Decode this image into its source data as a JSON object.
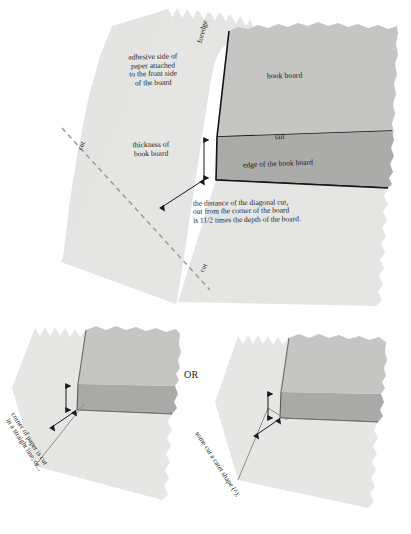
{
  "figure": {
    "title_alt": "Covering a book board corner",
    "colors": {
      "paper": "#e3e3e1",
      "paper_shadow": "#d6d6d4",
      "board_top": "#c3c3c1",
      "board_edge": "#a9a9a7",
      "outline": "#141414",
      "dashed_cut": "#9a9a98",
      "arrow": "#1a1a1a",
      "background": "#ffffff",
      "text": "#1d1d1d"
    }
  },
  "top_diagram": {
    "labels": {
      "adhesive": "adhesive side of\npaper attached\nto the front side\nof the board",
      "foredge": "foredge",
      "book_board": "book board",
      "tail": "tail",
      "edge_of_board": "edge of the book board",
      "thickness": "thickness of\nbook board",
      "distance_note": "the distance of the diagonal cut,\nout from the corner of the board\nis 11/2 times the depth of the board.",
      "cut_upper": "cut",
      "cut_lower": "cut"
    }
  },
  "bottom_left_diagram": {
    "caption_line_1": "corner of paper is cut",
    "caption_line_2": "in a straight line, or..."
  },
  "separator": {
    "or_label": "OR"
  },
  "bottom_right_diagram": {
    "caption": "some cut a caret shape (^)."
  }
}
